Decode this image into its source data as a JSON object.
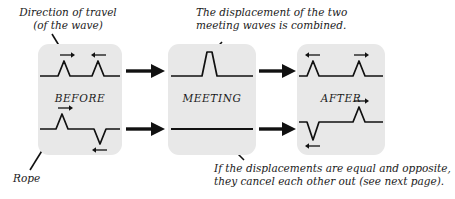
{
  "figure": {
    "title_implied": "Superposition of two wave pulses on a rope",
    "background": "#ffffff",
    "panel_fill": "#e8e8e8",
    "ink": "#111111"
  },
  "captions": {
    "direction_of_travel": "Direction of travel\n(of the wave)",
    "rope": "Rope",
    "combined": "The displacement of the two\nmeeting waves is combined.",
    "cancel": "If the displacements are equal and opposite,\nthey cancel each other out (see next page)."
  },
  "panels": [
    {
      "id": "before",
      "label": "BEFORE",
      "rows": [
        {
          "id": "before-top",
          "description": "Two upward pulses approaching each other",
          "pulses": [
            {
              "shape": "up",
              "direction": "right",
              "arrow_glyph": "→"
            },
            {
              "shape": "up",
              "direction": "left",
              "arrow_glyph": "←"
            }
          ]
        },
        {
          "id": "before-bottom",
          "description": "One upward pulse and one downward pulse approaching each other",
          "pulses": [
            {
              "shape": "up",
              "direction": "right",
              "arrow_glyph": "→"
            },
            {
              "shape": "down",
              "direction": "left",
              "arrow_glyph": "←"
            }
          ]
        }
      ]
    },
    {
      "id": "meeting",
      "label": "MEETING",
      "rows": [
        {
          "id": "meeting-top",
          "description": "Pulses overlap: displacements add to one tall narrow pulse",
          "pulses": [
            {
              "shape": "tall-up",
              "direction": "none",
              "arrow_glyph": ""
            }
          ]
        },
        {
          "id": "meeting-bottom",
          "description": "Equal and opposite pulses cancel: rope is flat",
          "pulses": []
        }
      ]
    },
    {
      "id": "after",
      "label": "AFTER",
      "rows": [
        {
          "id": "after-top",
          "description": "Two upward pulses continuing apart",
          "pulses": [
            {
              "shape": "up",
              "direction": "left",
              "arrow_glyph": "←"
            },
            {
              "shape": "up",
              "direction": "right",
              "arrow_glyph": "→"
            }
          ]
        },
        {
          "id": "after-bottom",
          "description": "Downward pulse moving left, upward pulse moving right",
          "pulses": [
            {
              "shape": "down",
              "direction": "left",
              "arrow_glyph": "←"
            },
            {
              "shape": "up",
              "direction": "right",
              "arrow_glyph": "→"
            }
          ]
        }
      ]
    }
  ],
  "flow_arrows": [
    {
      "id": "before-to-meeting-top",
      "direction": "right"
    },
    {
      "id": "before-to-meeting-bottom",
      "direction": "right"
    },
    {
      "id": "meeting-to-after-top",
      "direction": "right"
    },
    {
      "id": "meeting-to-after-bottom",
      "direction": "right"
    }
  ],
  "pointers": [
    {
      "id": "pointer-direction-of-travel",
      "from": "caption-direction",
      "to": "before-top-left-pulse-arrow"
    },
    {
      "id": "pointer-rope",
      "from": "caption-rope",
      "to": "before-bottom-rope-line"
    },
    {
      "id": "pointer-combined",
      "from": "caption-combined",
      "to": "meeting-top-pulse"
    },
    {
      "id": "pointer-cancel",
      "from": "caption-cancel",
      "to": "meeting-bottom-flat-line"
    }
  ]
}
